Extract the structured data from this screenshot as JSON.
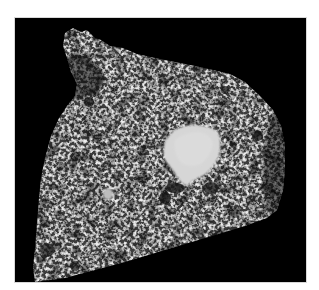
{
  "image": {
    "description": "Grayscale micrograph / CT cross-section of a porous granular sample on a black background",
    "background_color": "#000000",
    "page_background": "#ffffff",
    "sample": {
      "texture": "speckled bright grains with dark pores",
      "base_tone": "#3a3a3a",
      "grain_tone": "#e8e8e8"
    },
    "features": [
      {
        "name": "large-bright-inclusion",
        "tone": "#d4d4d4",
        "approx_center": [
          191,
          155
        ],
        "approx_size": [
          56,
          60
        ]
      },
      {
        "name": "small-bright-inclusion",
        "tone": "#bcbcbc",
        "approx_center": [
          108,
          195
        ],
        "approx_size": [
          10,
          12
        ]
      }
    ]
  }
}
